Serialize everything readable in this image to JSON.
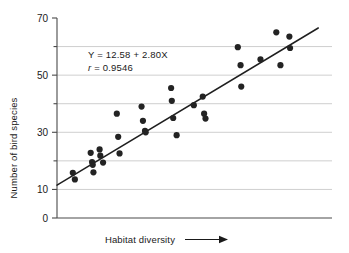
{
  "chart_data": {
    "type": "scatter",
    "title": "",
    "xlabel": "Habitat diversity",
    "ylabel": "Number of bird species",
    "xlabel_arrow": "→",
    "xlim": [
      0,
      20
    ],
    "ylim": [
      0,
      70
    ],
    "grid": "horizontal",
    "x_ticks_labeled": false,
    "y_ticks": [
      0,
      10,
      20,
      30,
      40,
      50,
      60,
      70
    ],
    "y_tick_labels": [
      "0",
      "10",
      "",
      "30",
      "",
      "50",
      "",
      "70"
    ],
    "y_gridlines": [
      10,
      20,
      30,
      40,
      50,
      60
    ],
    "annotations": [
      {
        "name": "regression-equation",
        "text": "Y = 12.58 + 2.80X"
      },
      {
        "name": "correlation-coefficient",
        "text_italic": "r",
        "text": " = 0.9546"
      }
    ],
    "regression_line": {
      "intercept": 12.58,
      "slope": 2.8,
      "r": 0.9546,
      "x_start": 0.0,
      "x_end": 19.0,
      "y_start": 11.5,
      "y_end": 66.5
    },
    "points": [
      {
        "x": 1.15,
        "y": 15.8
      },
      {
        "x": 1.3,
        "y": 13.5
      },
      {
        "x": 2.45,
        "y": 22.8
      },
      {
        "x": 2.55,
        "y": 19.6
      },
      {
        "x": 2.6,
        "y": 18.6
      },
      {
        "x": 2.65,
        "y": 16.0
      },
      {
        "x": 3.1,
        "y": 24.0
      },
      {
        "x": 3.15,
        "y": 21.8
      },
      {
        "x": 3.35,
        "y": 19.4
      },
      {
        "x": 4.35,
        "y": 36.5
      },
      {
        "x": 4.45,
        "y": 28.4
      },
      {
        "x": 4.55,
        "y": 22.6
      },
      {
        "x": 6.15,
        "y": 39.0
      },
      {
        "x": 6.25,
        "y": 34.0
      },
      {
        "x": 6.4,
        "y": 30.5
      },
      {
        "x": 6.45,
        "y": 30.0
      },
      {
        "x": 8.3,
        "y": 45.5
      },
      {
        "x": 8.35,
        "y": 41.0
      },
      {
        "x": 8.45,
        "y": 35.0
      },
      {
        "x": 8.7,
        "y": 29.0
      },
      {
        "x": 9.95,
        "y": 39.5
      },
      {
        "x": 10.6,
        "y": 42.5
      },
      {
        "x": 10.7,
        "y": 36.5
      },
      {
        "x": 10.8,
        "y": 34.8
      },
      {
        "x": 13.15,
        "y": 59.8
      },
      {
        "x": 13.35,
        "y": 53.5
      },
      {
        "x": 13.4,
        "y": 46.0
      },
      {
        "x": 14.8,
        "y": 55.5
      },
      {
        "x": 15.95,
        "y": 65.0
      },
      {
        "x": 16.25,
        "y": 53.5
      },
      {
        "x": 16.9,
        "y": 63.5
      },
      {
        "x": 16.95,
        "y": 59.5
      }
    ],
    "colors": {
      "point": "#232323",
      "line": "#1f1f1f",
      "grid": "#b9b9b9",
      "axis": "#4a4a4a",
      "text": "#1a1a1a",
      "background": "#ffffff"
    },
    "geometry": {
      "x_axis_px": {
        "x0": 57,
        "x1": 332
      },
      "y_axis_px": {
        "y_top": 18,
        "y_bottom": 218
      }
    }
  }
}
